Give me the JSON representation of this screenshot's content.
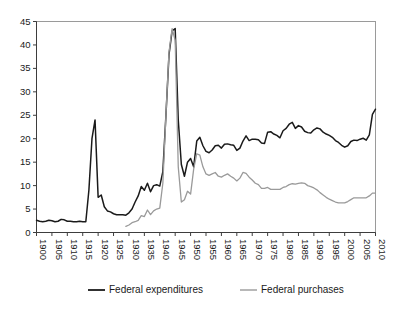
{
  "chart_data": {
    "type": "line",
    "title": "",
    "subtitle": "",
    "xlabel": "",
    "ylabel": "",
    "xlim": [
      1900,
      2010
    ],
    "ylim": [
      0,
      45
    ],
    "ytick_step": 5,
    "xtick_step": 5,
    "grid": false,
    "legend_position": "bottom",
    "yticks": [
      0,
      5,
      10,
      15,
      20,
      25,
      30,
      35,
      40,
      45
    ],
    "ytick_labels": [
      "0",
      "5",
      "10",
      "15",
      "20",
      "25",
      "30",
      "35",
      "40",
      "45"
    ],
    "xticks": [
      1900,
      1905,
      1910,
      1915,
      1920,
      1925,
      1930,
      1935,
      1940,
      1945,
      1950,
      1955,
      1960,
      1965,
      1970,
      1975,
      1980,
      1985,
      1990,
      1995,
      2000,
      2005,
      2010
    ],
    "xtick_labels": [
      "1900",
      "1905",
      "1910",
      "1915",
      "1920",
      "1925",
      "1930",
      "1935",
      "1940",
      "1945",
      "1950",
      "1955",
      "1960",
      "1965",
      "1970",
      "1975",
      "1980",
      "1985",
      "1990",
      "1995",
      "2000",
      "2005",
      "2010"
    ],
    "series": [
      {
        "name": "Federal expenditures",
        "color": "#1a1a1a",
        "width": 1.5,
        "x": [
          1900,
          1901,
          1902,
          1903,
          1904,
          1905,
          1906,
          1907,
          1908,
          1909,
          1910,
          1911,
          1912,
          1913,
          1914,
          1915,
          1916,
          1917,
          1918,
          1919,
          1920,
          1921,
          1922,
          1923,
          1924,
          1925,
          1926,
          1927,
          1928,
          1929,
          1930,
          1931,
          1932,
          1933,
          1934,
          1935,
          1936,
          1937,
          1938,
          1939,
          1940,
          1941,
          1942,
          1943,
          1944,
          1945,
          1946,
          1947,
          1948,
          1949,
          1950,
          1951,
          1952,
          1953,
          1954,
          1955,
          1956,
          1957,
          1958,
          1959,
          1960,
          1961,
          1962,
          1963,
          1964,
          1965,
          1966,
          1967,
          1968,
          1969,
          1970,
          1971,
          1972,
          1973,
          1974,
          1975,
          1976,
          1977,
          1978,
          1979,
          1980,
          1981,
          1982,
          1983,
          1984,
          1985,
          1986,
          1987,
          1988,
          1989,
          1990,
          1991,
          1992,
          1993,
          1994,
          1995,
          1996,
          1997,
          1998,
          1999,
          2000,
          2001,
          2002,
          2003,
          2004,
          2005,
          2006,
          2007,
          2008,
          2009,
          2010
        ],
        "values": [
          2.6,
          2.4,
          2.3,
          2.4,
          2.6,
          2.5,
          2.3,
          2.4,
          2.8,
          2.7,
          2.4,
          2.4,
          2.3,
          2.3,
          2.4,
          2.3,
          2.3,
          9.0,
          20.0,
          24.0,
          7.5,
          8.0,
          5.5,
          4.6,
          4.4,
          4.0,
          3.8,
          3.8,
          3.8,
          3.7,
          4.2,
          5.0,
          6.5,
          7.8,
          9.8,
          9.0,
          10.5,
          8.7,
          10.0,
          10.2,
          9.9,
          13.0,
          25.0,
          38.0,
          43.0,
          43.5,
          24.0,
          14.5,
          12.0,
          15.0,
          15.8,
          14.0,
          19.5,
          20.3,
          18.5,
          17.3,
          17.0,
          17.6,
          18.5,
          18.6,
          18.0,
          18.8,
          18.9,
          18.7,
          18.6,
          17.5,
          18.0,
          19.5,
          20.6,
          19.6,
          19.9,
          19.9,
          19.8,
          19.1,
          19.0,
          21.4,
          21.5,
          21.0,
          20.7,
          20.2,
          21.7,
          22.2,
          23.1,
          23.5,
          22.2,
          22.8,
          22.5,
          21.6,
          21.3,
          21.2,
          21.9,
          22.3,
          22.1,
          21.4,
          21.0,
          20.7,
          20.3,
          19.6,
          19.2,
          18.6,
          18.2,
          18.5,
          19.4,
          19.7,
          19.6,
          19.9,
          20.1,
          19.7,
          20.8,
          25.2,
          26.3
        ]
      },
      {
        "name": "Federal purchases",
        "color": "#9a9a9a",
        "width": 1.3,
        "x": [
          1929,
          1930,
          1931,
          1932,
          1933,
          1934,
          1935,
          1936,
          1937,
          1938,
          1939,
          1940,
          1941,
          1942,
          1943,
          1944,
          1945,
          1946,
          1947,
          1948,
          1949,
          1950,
          1951,
          1952,
          1953,
          1954,
          1955,
          1956,
          1957,
          1958,
          1959,
          1960,
          1961,
          1962,
          1963,
          1964,
          1965,
          1966,
          1967,
          1968,
          1969,
          1970,
          1971,
          1972,
          1973,
          1974,
          1975,
          1976,
          1977,
          1978,
          1979,
          1980,
          1981,
          1982,
          1983,
          1984,
          1985,
          1986,
          1987,
          1988,
          1989,
          1990,
          1991,
          1992,
          1993,
          1994,
          1995,
          1996,
          1997,
          1998,
          1999,
          2000,
          2001,
          2002,
          2003,
          2004,
          2005,
          2006,
          2007,
          2008,
          2009,
          2010
        ],
        "values": [
          1.3,
          1.6,
          2.1,
          2.3,
          2.6,
          3.6,
          3.4,
          4.8,
          3.8,
          4.6,
          5.0,
          5.2,
          10.5,
          25.0,
          38.5,
          43.5,
          41.0,
          14.0,
          6.5,
          7.0,
          8.8,
          8.2,
          13.5,
          16.8,
          16.5,
          14.0,
          12.5,
          12.2,
          12.5,
          12.8,
          12.0,
          11.8,
          12.2,
          12.5,
          12.0,
          11.6,
          11.0,
          11.6,
          12.8,
          12.6,
          11.8,
          11.2,
          10.5,
          10.2,
          9.4,
          9.4,
          9.6,
          9.2,
          9.2,
          9.2,
          9.2,
          9.6,
          9.8,
          10.2,
          10.4,
          10.3,
          10.5,
          10.6,
          10.5,
          10.0,
          9.8,
          9.5,
          9.1,
          8.5,
          8.0,
          7.5,
          7.1,
          6.8,
          6.5,
          6.3,
          6.3,
          6.3,
          6.6,
          7.0,
          7.4,
          7.4,
          7.4,
          7.4,
          7.4,
          7.8,
          8.4,
          8.4
        ]
      }
    ],
    "legend": [
      {
        "label": "Federal expenditures",
        "color": "#1a1a1a"
      },
      {
        "label": "Federal purchases",
        "color": "#9a9a9a"
      }
    ]
  }
}
